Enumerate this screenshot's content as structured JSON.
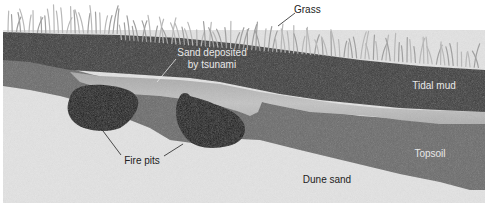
{
  "diagram": {
    "type": "geological cross-section",
    "layers": [
      {
        "id": "grass",
        "label": "Grass",
        "color": "#a8a8a8"
      },
      {
        "id": "tidal-mud",
        "label": "Tidal mud",
        "color": "#3f3f3f"
      },
      {
        "id": "tsunami-sand",
        "label": "Sand deposited\nby tsunami",
        "label_line1": "Sand deposited",
        "label_line2": "by tsunami",
        "color": "#b9b9b9"
      },
      {
        "id": "topsoil",
        "label": "Topsoil",
        "color": "#6b6b6b"
      },
      {
        "id": "dune-sand",
        "label": "Dune sand",
        "color": "#e2e2e2"
      }
    ],
    "features": [
      {
        "id": "fire-pits",
        "label": "Fire pits",
        "color": "#1c1c1c",
        "count": 2
      }
    ],
    "label_colors": {
      "on_dark": "#e8e8e8",
      "on_light": "#222222"
    }
  }
}
